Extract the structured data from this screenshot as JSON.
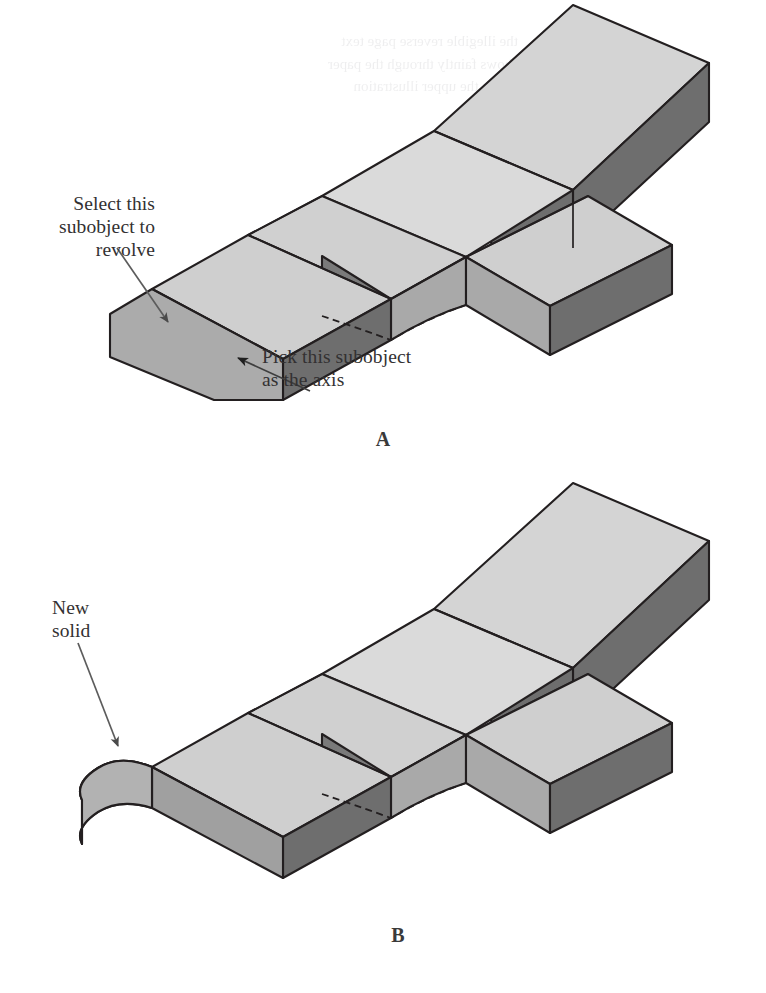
{
  "figure": {
    "palette": {
      "top_light": "#d4d4d4",
      "top_mid": "#c3c3c3",
      "face_mid": "#ababab",
      "face_dark": "#777777",
      "face_darker": "#6e6e6e",
      "outline": "#231f20",
      "paper": "#ffffff",
      "text": "#333132",
      "leader": "#5c5c5c"
    }
  },
  "panels": [
    {
      "id": "a",
      "label": "A",
      "callouts": [
        {
          "name": "select-subobject-callout",
          "text": "Select this\nsubobject to\nrevolve",
          "align": "right"
        },
        {
          "name": "pick-axis-callout",
          "text": "Pick this subobject\nas the axis",
          "align": "left"
        }
      ]
    },
    {
      "id": "b",
      "label": "B",
      "callouts": [
        {
          "name": "new-solid-callout",
          "text": "New\nsolid",
          "align": "left"
        }
      ]
    }
  ],
  "showthrough": {
    "note": "faint reverse-side text bleed",
    "lines": "the illegible reverse page text\nshows faintly through the paper\nabove the upper illustration"
  }
}
